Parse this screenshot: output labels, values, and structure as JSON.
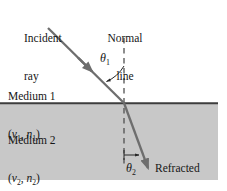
{
  "figure": {
    "background_color": "#ffffff",
    "medium2_fill_color": "#c8c8c8",
    "line_color": "#6e6e6e",
    "boundary_color": "#404040",
    "text_color": "#161616"
  },
  "labels": {
    "incident_ray_line1": "Incident",
    "incident_ray_line2": "ray",
    "normal_line_line1": "Normal",
    "normal_line_line2": "line",
    "refracted_ray_line1": "Refracted",
    "refracted_ray_line2": "ray",
    "medium_1": "Medium 1",
    "medium_2": "Medium 2",
    "medium_1_params_open": "(",
    "medium_1_v": "v",
    "medium_1_v_sub": "1",
    "medium_1_comma": ", ",
    "medium_1_n": "n",
    "medium_1_n_sub": "1",
    "medium_1_params_close": ")",
    "medium_2_params_open": "(",
    "medium_2_v": "v",
    "medium_2_v_sub": "2",
    "medium_2_comma": ", ",
    "medium_2_n": "n",
    "medium_2_n_sub": "2",
    "medium_2_params_close": ")",
    "theta_1_symbol": "θ",
    "theta_1_sub": "1",
    "theta_2_symbol": "θ",
    "theta_2_sub": "2"
  },
  "geometry": {
    "boundary_y": 103,
    "normal_x": 124,
    "normal_top_y": 38,
    "normal_bottom_y": 166,
    "incident_start_x": 48,
    "incident_start_y": 28,
    "incident_end_x": 124,
    "incident_end_y": 103,
    "refracted_end_x": 148,
    "refracted_end_y": 168,
    "medium2_left": 0,
    "medium2_right": 218,
    "medium2_bottom": 180
  }
}
